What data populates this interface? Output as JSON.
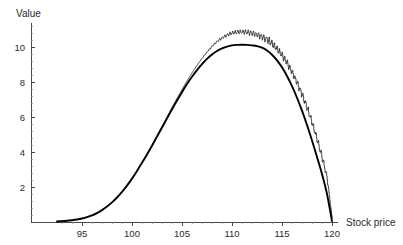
{
  "chart_data": {
    "type": "line",
    "title": "",
    "xlabel": "Stock price",
    "ylabel": "Value",
    "xlim": [
      92.5,
      120.6
    ],
    "ylim": [
      0,
      11.4
    ],
    "xticks": [
      95,
      100,
      105,
      110,
      115,
      120
    ],
    "yticks": [
      2,
      4,
      6,
      8,
      10
    ],
    "x_minor_step": 1,
    "y_minor_step": 0.4,
    "grid": false,
    "legend": null,
    "series": [
      {
        "name": "smooth-value-curve",
        "style": "solid-thick",
        "color": "#000000",
        "x": [
          92.5,
          93.0,
          93.5,
          94.0,
          94.5,
          95.0,
          95.5,
          96.0,
          96.5,
          97.0,
          97.5,
          98.0,
          98.5,
          99.0,
          99.5,
          100.0,
          100.5,
          101.0,
          101.5,
          102.0,
          102.5,
          103.0,
          103.5,
          104.0,
          104.5,
          105.0,
          105.5,
          106.0,
          106.5,
          107.0,
          107.5,
          108.0,
          108.5,
          109.0,
          109.5,
          110.0,
          110.5,
          111.0,
          111.5,
          112.0,
          112.5,
          113.0,
          113.5,
          114.0,
          114.5,
          115.0,
          115.5,
          116.0,
          116.5,
          117.0,
          117.5,
          118.0,
          118.5,
          119.0,
          119.5,
          120.0
        ],
        "y": [
          0.03,
          0.05,
          0.07,
          0.1,
          0.14,
          0.2,
          0.28,
          0.38,
          0.51,
          0.68,
          0.88,
          1.12,
          1.4,
          1.72,
          2.08,
          2.48,
          2.92,
          3.38,
          3.86,
          4.36,
          4.88,
          5.4,
          5.92,
          6.44,
          6.94,
          7.42,
          7.88,
          8.3,
          8.68,
          9.02,
          9.32,
          9.57,
          9.77,
          9.92,
          10.02,
          10.09,
          10.12,
          10.13,
          10.12,
          10.09,
          10.05,
          9.96,
          9.8,
          9.56,
          9.24,
          8.84,
          8.34,
          7.76,
          7.1,
          6.36,
          5.54,
          4.66,
          3.72,
          2.74,
          1.6,
          0.05
        ]
      },
      {
        "name": "jagged-lattice-curve",
        "style": "thin-sawtooth",
        "color": "#111111",
        "x": [
          92.5,
          93.0,
          93.5,
          94.0,
          94.5,
          95.0,
          95.5,
          96.0,
          96.5,
          97.0,
          97.5,
          98.0,
          98.5,
          99.0,
          99.5,
          100.0,
          100.5,
          101.0,
          101.5,
          102.0,
          102.5,
          103.0,
          103.5,
          104.0,
          104.5,
          105.0,
          105.5,
          106.0,
          106.5,
          107.0,
          107.5,
          108.0,
          108.5,
          109.0,
          109.5,
          110.0,
          110.5,
          111.0,
          111.5,
          112.0,
          112.5,
          113.0,
          113.5,
          114.0,
          114.5,
          115.0,
          115.5,
          116.0,
          116.5,
          117.0,
          117.5,
          118.0,
          118.5,
          119.0,
          119.5,
          120.0
        ],
        "y": [
          0.03,
          0.05,
          0.07,
          0.1,
          0.14,
          0.2,
          0.28,
          0.38,
          0.52,
          0.69,
          0.89,
          1.13,
          1.41,
          1.73,
          2.09,
          2.49,
          2.93,
          3.4,
          3.89,
          4.4,
          4.93,
          5.46,
          6.0,
          6.54,
          7.06,
          7.57,
          8.06,
          8.52,
          8.95,
          9.34,
          9.7,
          10.02,
          10.29,
          10.5,
          10.66,
          10.76,
          10.81,
          10.82,
          10.8,
          10.74,
          10.66,
          10.54,
          10.36,
          10.12,
          9.82,
          9.46,
          9.02,
          8.5,
          7.9,
          7.22,
          6.46,
          5.6,
          4.66,
          3.62,
          2.48,
          0.2
        ]
      }
    ]
  },
  "labels": {
    "y_axis_title": "Value",
    "x_axis_title": "Stock price"
  }
}
